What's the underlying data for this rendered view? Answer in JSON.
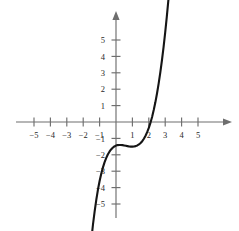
{
  "figure": {
    "name": "cubic-function-graph",
    "background_color": "#ffffff",
    "curve_color": "#151515",
    "axis_color": "#6e6e6e",
    "label_color": "#2a2a2a"
  },
  "chart_data": {
    "type": "line",
    "title": "",
    "subtitle": "",
    "xlabel": "",
    "ylabel": "",
    "xlim": [
      -6.1,
      6.6
    ],
    "ylim": [
      -6.0,
      6.4
    ],
    "grid": false,
    "legend": null,
    "x_ticks": [
      -5,
      -4,
      -3,
      -2,
      -1,
      1,
      2,
      3,
      4,
      5
    ],
    "x_tick_labels": [
      "−5",
      "−4",
      "−3",
      "−2",
      "−1",
      "1",
      "2",
      "3",
      "4",
      "5"
    ],
    "y_ticks": [
      -5,
      -4,
      -3,
      -2,
      -1,
      1,
      2,
      3,
      4,
      5
    ],
    "y_tick_labels": [
      "−5",
      "−4",
      "−3",
      "−2",
      "−1",
      "1",
      "2",
      "3",
      "4",
      "5"
    ],
    "series": [
      {
        "name": "cubic",
        "equation": "y = (x + 1)(x - 1)(x - 3)",
        "expanded": "y = x^3 - 3x^2 - x + 3",
        "x_intercepts": [
          -1,
          1,
          3
        ],
        "y_intercept": 3,
        "local_maximum": [
          -0.12,
          3.06
        ],
        "local_minimum": [
          2.12,
          -3.06
        ],
        "x_range": [
          -1.78,
          3.42
        ],
        "x": [
          -1.78,
          -1.7,
          -1.6,
          -1.5,
          -1.4,
          -1.3,
          -1.2,
          -1.1,
          -1.0,
          -0.9,
          -0.8,
          -0.7,
          -0.6,
          -0.5,
          -0.4,
          -0.3,
          -0.2,
          -0.1,
          0.0,
          0.1,
          0.2,
          0.3,
          0.4,
          0.5,
          0.6,
          0.7,
          0.8,
          0.9,
          1.0,
          1.1,
          1.2,
          1.3,
          1.4,
          1.5,
          1.6,
          1.7,
          1.8,
          1.9,
          2.0,
          2.1,
          2.2,
          2.3,
          2.4,
          2.5,
          2.6,
          2.7,
          2.8,
          2.9,
          3.0,
          3.1,
          3.2,
          3.3,
          3.4,
          3.42
        ],
        "y": [
          -10.35,
          -9.29,
          -8.18,
          -7.13,
          -6.22,
          -5.43,
          -4.73,
          -4.12,
          -3.6,
          -3.16,
          -2.78,
          -2.46,
          -2.2,
          -1.98,
          -1.81,
          -1.67,
          -1.57,
          -1.49,
          -1.44,
          -1.41,
          -1.4,
          -1.4,
          -1.41,
          -1.43,
          -1.45,
          -1.47,
          -1.49,
          -1.5,
          -1.5,
          -1.49,
          -1.47,
          -1.43,
          -1.37,
          -1.28,
          -1.17,
          -1.02,
          -0.84,
          -0.62,
          -0.36,
          -0.05,
          0.31,
          0.73,
          1.2,
          1.74,
          2.34,
          3.01,
          3.75,
          4.57,
          5.46,
          6.44,
          7.5,
          8.64,
          9.88,
          10.14
        ]
      }
    ]
  },
  "axes": {
    "x_axis_name": "horizontal-axis",
    "y_axis_name": "vertical-axis",
    "x_arrow": "right-arrow",
    "y_arrow": "up-arrow"
  }
}
